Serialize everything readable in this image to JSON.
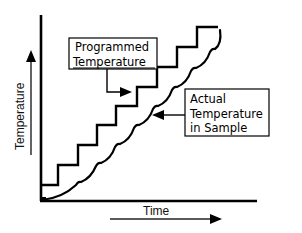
{
  "diagram": {
    "y_axis_label": "Temperature",
    "x_axis_label": "Time",
    "programmed_label": {
      "line1": "Programmed",
      "line2": "Temperature"
    },
    "actual_label": {
      "line1": "Actual",
      "line2": "Temperature",
      "line3": "in Sample"
    },
    "colors": {
      "line": "#000000",
      "background": "#ffffff"
    },
    "programmed_steps": [
      {
        "x": 41,
        "y": 185
      },
      {
        "x": 58,
        "y": 185
      },
      {
        "x": 58,
        "y": 165
      },
      {
        "x": 78,
        "y": 165
      },
      {
        "x": 78,
        "y": 145
      },
      {
        "x": 97,
        "y": 145
      },
      {
        "x": 97,
        "y": 125
      },
      {
        "x": 116,
        "y": 125
      },
      {
        "x": 116,
        "y": 106
      },
      {
        "x": 137,
        "y": 106
      },
      {
        "x": 137,
        "y": 87
      },
      {
        "x": 157,
        "y": 87
      },
      {
        "x": 157,
        "y": 67
      },
      {
        "x": 177,
        "y": 67
      },
      {
        "x": 177,
        "y": 47
      },
      {
        "x": 197,
        "y": 47
      },
      {
        "x": 197,
        "y": 27
      },
      {
        "x": 218,
        "y": 27
      }
    ]
  }
}
